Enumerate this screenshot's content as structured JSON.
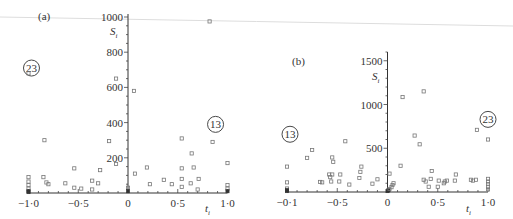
{
  "chart_data": [
    {
      "type": "scatter",
      "panel_label": "(a)",
      "title": "",
      "xlabel": "t_i",
      "ylabel": "S_i",
      "xlim": [
        -1.0,
        1.0
      ],
      "ylim": [
        0,
        1000
      ],
      "x_ticks": [
        "-1·0",
        "-0·5",
        "0",
        "0·5",
        "1·0"
      ],
      "y_ticks": [
        "200",
        "400",
        "600",
        "800",
        "1000"
      ],
      "grid": false,
      "annotations": [
        {
          "text": "23",
          "circled": true,
          "x": -0.97,
          "y": 710
        },
        {
          "text": "13",
          "circled": true,
          "x": 0.88,
          "y": 390
        }
      ],
      "series": [
        {
          "name": "points",
          "points": [
            [
              -1.0,
              680
            ],
            [
              -1.0,
              90
            ],
            [
              -1.0,
              65
            ],
            [
              -1.0,
              45
            ],
            [
              -1.0,
              25
            ],
            [
              -1.0,
              10
            ],
            [
              -1.0,
              5
            ],
            [
              -0.85,
              90
            ],
            [
              -0.82,
              60
            ],
            [
              -0.8,
              50
            ],
            [
              -0.84,
              300
            ],
            [
              -0.63,
              55
            ],
            [
              -0.54,
              140
            ],
            [
              -0.54,
              30
            ],
            [
              -0.47,
              25
            ],
            [
              -0.36,
              70
            ],
            [
              -0.36,
              20
            ],
            [
              -0.3,
              55
            ],
            [
              -0.28,
              130
            ],
            [
              -0.19,
              295
            ],
            [
              -0.12,
              165
            ],
            [
              -0.12,
              650
            ],
            [
              0.0,
              30
            ],
            [
              0.0,
              10
            ],
            [
              0.06,
              580
            ],
            [
              0.07,
              110
            ],
            [
              0.19,
              145
            ],
            [
              0.22,
              50
            ],
            [
              0.36,
              75
            ],
            [
              0.44,
              50
            ],
            [
              0.54,
              310
            ],
            [
              0.54,
              140
            ],
            [
              0.54,
              80
            ],
            [
              0.54,
              35
            ],
            [
              0.63,
              55
            ],
            [
              0.64,
              225
            ],
            [
              0.66,
              145
            ],
            [
              0.7,
              20
            ],
            [
              0.71,
              80
            ],
            [
              0.82,
              975
            ],
            [
              0.85,
              290
            ],
            [
              1.0,
              170
            ],
            [
              1.0,
              45
            ],
            [
              1.0,
              25
            ],
            [
              1.0,
              10
            ]
          ]
        }
      ]
    },
    {
      "type": "scatter",
      "panel_label": "(b)",
      "title": "",
      "xlabel": "t_i",
      "ylabel": "S_i",
      "xlim": [
        -1.0,
        1.0
      ],
      "ylim": [
        0,
        1600
      ],
      "x_ticks": [
        "-0·1",
        "-0·5",
        "0",
        "0·5",
        "1·0"
      ],
      "y_ticks": [
        "500",
        "1000",
        "1500"
      ],
      "grid": false,
      "annotations": [
        {
          "text": "13",
          "circled": true,
          "x": -0.97,
          "y": 660
        },
        {
          "text": "23",
          "circled": true,
          "x": 1.0,
          "y": 830
        }
      ],
      "series": [
        {
          "name": "points",
          "points": [
            [
              -1.0,
              290
            ],
            [
              -1.0,
              110
            ],
            [
              -1.0,
              40
            ],
            [
              -1.0,
              20
            ],
            [
              -1.0,
              10
            ],
            [
              -0.8,
              390
            ],
            [
              -0.75,
              480
            ],
            [
              -0.67,
              115
            ],
            [
              -0.65,
              110
            ],
            [
              -0.58,
              200
            ],
            [
              -0.57,
              170
            ],
            [
              -0.55,
              200
            ],
            [
              -0.56,
              120
            ],
            [
              -0.55,
              395
            ],
            [
              -0.54,
              345
            ],
            [
              -0.48,
              120
            ],
            [
              -0.47,
              200
            ],
            [
              -0.42,
              580
            ],
            [
              -0.38,
              85
            ],
            [
              -0.28,
              160
            ],
            [
              -0.27,
              230
            ],
            [
              -0.26,
              290
            ],
            [
              -0.15,
              95
            ],
            [
              -0.1,
              145
            ],
            [
              0.0,
              10
            ],
            [
              0.01,
              20
            ],
            [
              0.02,
              35
            ],
            [
              0.04,
              55
            ],
            [
              0.05,
              80
            ],
            [
              0.06,
              100
            ],
            [
              0.02,
              210
            ],
            [
              0.13,
              300
            ],
            [
              0.15,
              1085
            ],
            [
              0.27,
              645
            ],
            [
              0.32,
              545
            ],
            [
              0.36,
              1150
            ],
            [
              0.36,
              140
            ],
            [
              0.38,
              120
            ],
            [
              0.41,
              60
            ],
            [
              0.43,
              150
            ],
            [
              0.44,
              240
            ],
            [
              0.5,
              60
            ],
            [
              0.51,
              130
            ],
            [
              0.56,
              100
            ],
            [
              0.57,
              120
            ],
            [
              0.59,
              130
            ],
            [
              0.67,
              130
            ],
            [
              0.68,
              200
            ],
            [
              0.83,
              140
            ],
            [
              0.85,
              130
            ],
            [
              0.88,
              140
            ],
            [
              0.89,
              710
            ],
            [
              1.0,
              600
            ],
            [
              1.0,
              150
            ],
            [
              1.0,
              120
            ],
            [
              1.0,
              90
            ],
            [
              1.0,
              60
            ],
            [
              1.0,
              30
            ]
          ]
        }
      ]
    }
  ]
}
